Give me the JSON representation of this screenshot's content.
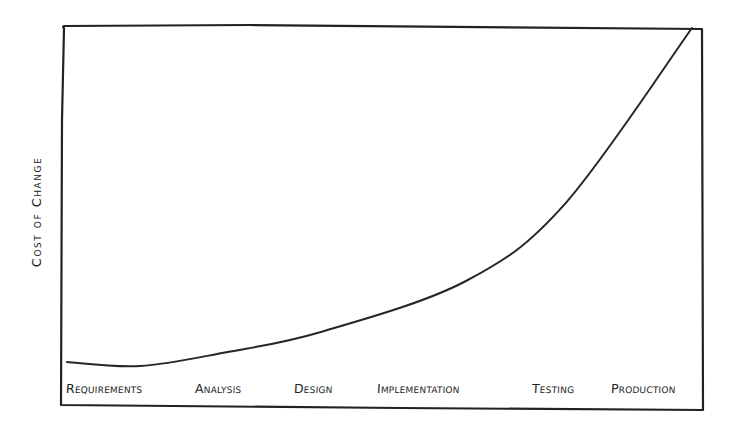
{
  "chart_data": {
    "type": "line",
    "title": "",
    "xlabel": "",
    "ylabel": "Cost of Change",
    "categories": [
      "Requirements",
      "Analysis",
      "Design",
      "Implementation",
      "Testing",
      "Production"
    ],
    "series": [
      {
        "name": "Cost of Change",
        "values": [
          1,
          4,
          10,
          25,
          48,
          100
        ]
      }
    ],
    "value_scale": "relative (0 = chart floor, 100 = top of frame); hand-drawn, no numeric ticks",
    "ylim": [
      0,
      100
    ],
    "grid": false,
    "legend": "none",
    "style": "hand-drawn sketch, black ink on white",
    "curve_shape": "flat near floor through Requirements/Analysis, gradual rise through Design/Implementation, steep exponential rise through Testing, near-vertical at Production"
  },
  "labels": {
    "y_axis": "Cost of Change",
    "x_axis": [
      "Requirements",
      "Analysis",
      "Design",
      "Implementation",
      "Testing",
      "Production"
    ]
  },
  "colors": {
    "ink": "#222222",
    "background": "#ffffff"
  }
}
